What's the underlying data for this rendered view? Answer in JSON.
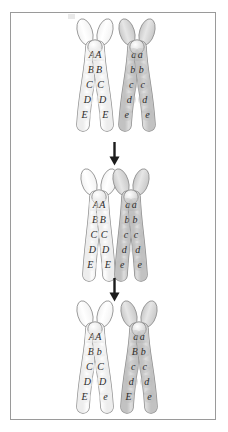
{
  "figure": {
    "border_color": "#9a9a9a",
    "background": "#ffffff"
  },
  "legend": {
    "maternal_shade": "#e8e8e8",
    "paternal_shade": "#b8b8b8",
    "centromere_color": "#fafafa",
    "outline_color": "#8d8d8d"
  },
  "arrows": [
    {
      "name": "arrow-to-synapsis",
      "direction": "down",
      "color": "#1c1c1c"
    },
    {
      "name": "arrow-to-recombinants",
      "direction": "down",
      "color": "#1c1c1c"
    }
  ],
  "panels": [
    {
      "id": "panel-top",
      "stage_label": "Homologous pair before crossing over",
      "chromosomes": [
        {
          "id": "maternal-pair",
          "shade": "light",
          "chromatids": [
            {
              "id": "chromatid-1",
              "side": "left",
              "alleles": [
                "A",
                "B",
                "C",
                "D",
                "E"
              ]
            },
            {
              "id": "chromatid-2",
              "side": "right",
              "alleles": [
                "A",
                "B",
                "C",
                "D",
                "E"
              ]
            }
          ]
        },
        {
          "id": "paternal-pair",
          "shade": "dark",
          "chromatids": [
            {
              "id": "chromatid-3",
              "side": "left",
              "alleles": [
                "a",
                "b",
                "c",
                "d",
                "e"
              ]
            },
            {
              "id": "chromatid-4",
              "side": "right",
              "alleles": [
                "a",
                "b",
                "c",
                "d",
                "e"
              ]
            }
          ]
        }
      ]
    },
    {
      "id": "panel-middle",
      "stage_label": "Synapsis — chiasma formation",
      "chromosomes": [
        {
          "id": "maternal-pair",
          "shade": "light",
          "chromatids": [
            {
              "id": "chromatid-1",
              "side": "left",
              "alleles": [
                "A",
                "B",
                "C",
                "D",
                "E"
              ]
            },
            {
              "id": "chromatid-2",
              "side": "right",
              "alleles": [
                "A",
                "B",
                "C",
                "D",
                "E"
              ]
            }
          ]
        },
        {
          "id": "paternal-pair",
          "shade": "dark",
          "chromatids": [
            {
              "id": "chromatid-3",
              "side": "left",
              "alleles": [
                "a",
                "b",
                "c",
                "d",
                "e"
              ]
            },
            {
              "id": "chromatid-4",
              "side": "right",
              "alleles": [
                "a",
                "b",
                "c",
                "d",
                "e"
              ]
            }
          ]
        }
      ]
    },
    {
      "id": "panel-bottom",
      "stage_label": "Recombinant chromatids after crossing over",
      "chromosomes": [
        {
          "id": "maternal-pair",
          "shade": "light",
          "chromatids": [
            {
              "id": "chromatid-1",
              "side": "left",
              "alleles": [
                "A",
                "B",
                "C",
                "D",
                "E"
              ]
            },
            {
              "id": "chromatid-2",
              "side": "right",
              "alleles": [
                "A",
                "b",
                "C",
                "D",
                "e"
              ]
            }
          ]
        },
        {
          "id": "paternal-pair",
          "shade": "dark",
          "chromatids": [
            {
              "id": "chromatid-3",
              "side": "left",
              "alleles": [
                "a",
                "B",
                "c",
                "d",
                "E"
              ]
            },
            {
              "id": "chromatid-4",
              "side": "right",
              "alleles": [
                "a",
                "b",
                "c",
                "d",
                "e"
              ]
            }
          ]
        }
      ]
    }
  ]
}
